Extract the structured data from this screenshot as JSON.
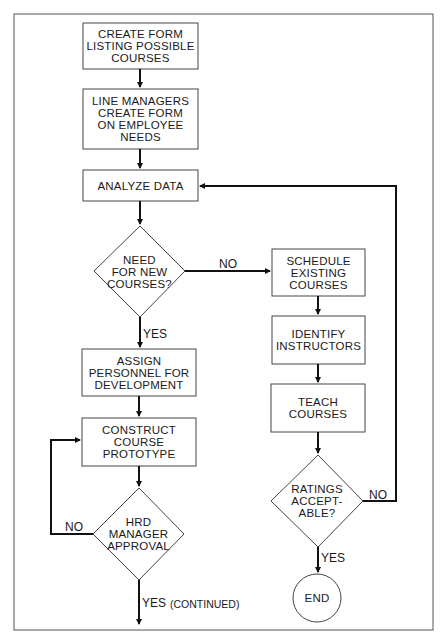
{
  "flowchart": {
    "nodes": [
      {
        "id": "create_form",
        "shape": "rect",
        "text": "CREATE FORM\nLISTING POSSIBLE\nCOURSES"
      },
      {
        "id": "line_managers",
        "shape": "rect",
        "text": "LINE MANAGERS\nCREATE FORM\nON EMPLOYEE\nNEEDS"
      },
      {
        "id": "analyze_data",
        "shape": "rect",
        "text": "ANALYZE DATA"
      },
      {
        "id": "need_new",
        "shape": "diamond",
        "text": "NEED\nFOR NEW\nCOURSES?"
      },
      {
        "id": "assign_personnel",
        "shape": "rect",
        "text": "ASSIGN\nPERSONNEL FOR\nDEVELOPMENT"
      },
      {
        "id": "construct_prototype",
        "shape": "rect",
        "text": "CONSTRUCT\nCOURSE\nPROTOTYPE"
      },
      {
        "id": "hrd_approval",
        "shape": "diamond",
        "text": "HRD\nMANAGER\nAPPROVAL"
      },
      {
        "id": "schedule_existing",
        "shape": "rect",
        "text": "SCHEDULE\nEXISTING\nCOURSES"
      },
      {
        "id": "identify_instructors",
        "shape": "rect",
        "text": "IDENTIFY\nINSTRUCTORS"
      },
      {
        "id": "teach_courses",
        "shape": "rect",
        "text": "TEACH\nCOURSES"
      },
      {
        "id": "ratings_acceptable",
        "shape": "diamond",
        "text": "RATINGS\nACCEPT-\nABLE?"
      },
      {
        "id": "end",
        "shape": "circle",
        "text": "END"
      }
    ],
    "edge_labels": {
      "need_no": "NO",
      "need_yes": "YES",
      "hrd_no": "NO",
      "hrd_yes": "YES",
      "hrd_yes_note": "(CONTINUED)",
      "ratings_no": "NO",
      "ratings_yes": "YES"
    },
    "edges": [
      {
        "from": "create_form",
        "to": "line_managers"
      },
      {
        "from": "line_managers",
        "to": "analyze_data"
      },
      {
        "from": "analyze_data",
        "to": "need_new"
      },
      {
        "from": "need_new",
        "to": "schedule_existing",
        "label": "NO"
      },
      {
        "from": "need_new",
        "to": "assign_personnel",
        "label": "YES"
      },
      {
        "from": "assign_personnel",
        "to": "construct_prototype"
      },
      {
        "from": "construct_prototype",
        "to": "hrd_approval"
      },
      {
        "from": "hrd_approval",
        "to": "construct_prototype",
        "label": "NO"
      },
      {
        "from": "hrd_approval",
        "to": "continued",
        "label": "YES (CONTINUED)"
      },
      {
        "from": "schedule_existing",
        "to": "identify_instructors"
      },
      {
        "from": "identify_instructors",
        "to": "teach_courses"
      },
      {
        "from": "teach_courses",
        "to": "ratings_acceptable"
      },
      {
        "from": "ratings_acceptable",
        "to": "analyze_data",
        "label": "NO"
      },
      {
        "from": "ratings_acceptable",
        "to": "end",
        "label": "YES"
      }
    ]
  }
}
